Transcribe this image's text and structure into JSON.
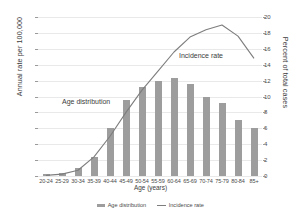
{
  "chart_data": {
    "type": "bar",
    "title": "",
    "xlabel": "Age (years)",
    "ylabel": "Annual rate per 100,000",
    "ylabel_right": "Percent of total cases",
    "categories": [
      "20-24",
      "25-29",
      "30-34",
      "35-39",
      "40-44",
      "45-49",
      "50-54",
      "55-59",
      "60-64",
      "65-69",
      "70-74",
      "75-79",
      "80-84",
      "85+"
    ],
    "ylim": [
      0,
      500
    ],
    "ylim_right": [
      0,
      20
    ],
    "yticks": [
      "0",
      "50",
      "100",
      "150",
      "200",
      "250",
      "300",
      "350",
      "400",
      "450",
      "500"
    ],
    "yticks_right": [
      "0",
      "2",
      "4",
      "6",
      "8",
      "10",
      "12",
      "14",
      "16",
      "18",
      "20"
    ],
    "grid": true,
    "legend_position": "bottom",
    "series": [
      {
        "name": "Age distribution",
        "type": "bar",
        "axis": "right",
        "unit": "percent of total cases",
        "color": "#9d9d9d",
        "values": [
          0.2,
          0.4,
          1.0,
          2.4,
          6.1,
          9.6,
          11.2,
          12.0,
          12.3,
          11.6,
          10.0,
          9.2,
          7.0,
          6.0
        ]
      },
      {
        "name": "Incidence rate",
        "type": "line",
        "axis": "left",
        "unit": "annual rate per 100,000",
        "color": "#7d7d7d",
        "values": [
          2,
          6,
          18,
          60,
          125,
          200,
          270,
          330,
          390,
          437,
          460,
          475,
          440,
          370
        ]
      }
    ],
    "annotations": [
      {
        "text": "Age distribution",
        "target": "Age distribution"
      },
      {
        "text": "Incidence rate",
        "target": "Incidence rate"
      }
    ]
  },
  "legend": {
    "items": [
      {
        "label": "Age distribution",
        "swatch": "bar-swatch"
      },
      {
        "label": "Incidence rate",
        "swatch": "line-swatch"
      }
    ]
  }
}
